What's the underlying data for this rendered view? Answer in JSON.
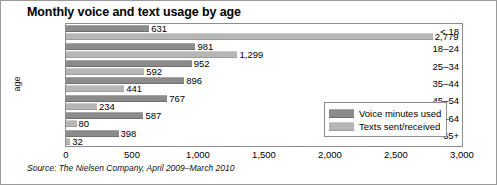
{
  "chart_data": {
    "type": "bar",
    "orientation": "horizontal",
    "title": "Monthly voice and text usage by age",
    "xlabel": "",
    "ylabel": "age",
    "xlim": [
      0,
      3000
    ],
    "xticks": [
      "0",
      "500",
      "1,000",
      "1,500",
      "2,000",
      "2,500",
      "3,000"
    ],
    "xtick_values": [
      0,
      500,
      1000,
      1500,
      2000,
      2500,
      3000
    ],
    "categories": [
      "< 18",
      "18–24",
      "25–34",
      "35–44",
      "45–54",
      "55–64",
      "65+"
    ],
    "grid": false,
    "legend_position": "bottom-right",
    "series": [
      {
        "name": "Voice minutes used",
        "color": "#8b8b8b",
        "values": [
          631,
          981,
          952,
          896,
          767,
          587,
          398
        ],
        "labels": [
          "631",
          "981",
          "952",
          "896",
          "767",
          "587",
          "398"
        ]
      },
      {
        "name": "Texts sent/received",
        "color": "#b6b6b6",
        "values": [
          2779,
          1299,
          592,
          441,
          234,
          80,
          32
        ],
        "labels": [
          "2,779",
          "1,299",
          "592",
          "441",
          "234",
          "80",
          "32"
        ]
      }
    ],
    "source": "Source: The Nielsen Company, April 2009–March 2010"
  },
  "legend": {
    "items": [
      {
        "label": "Voice minutes used",
        "swatch": "voice"
      },
      {
        "label": "Texts sent/received",
        "swatch": "text"
      }
    ]
  }
}
